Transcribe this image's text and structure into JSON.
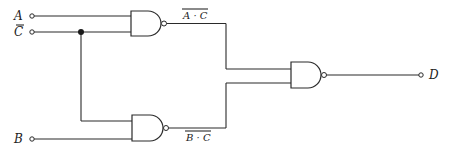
{
  "diagram": {
    "type": "logic-circuit",
    "inputs": [
      {
        "id": "A",
        "label": "A"
      },
      {
        "id": "C",
        "label": "C"
      },
      {
        "id": "B",
        "label": "B"
      }
    ],
    "output": {
      "id": "D",
      "label": "D"
    },
    "gates": [
      {
        "id": "nand1",
        "type": "NAND",
        "inputs": [
          "A",
          "C"
        ],
        "output_label": "A · C",
        "overbar": true
      },
      {
        "id": "nand2",
        "type": "NAND",
        "inputs": [
          "C",
          "B"
        ],
        "output_label": "B · C",
        "overbar": true
      },
      {
        "id": "nand3",
        "type": "NAND",
        "inputs": [
          "nand1",
          "nand2"
        ],
        "output": "D"
      }
    ],
    "labels": {
      "a": "A",
      "c": "C",
      "b": "B",
      "d": "D",
      "nand1_out": "A · C",
      "nand2_out": "B · C"
    },
    "colors": {
      "line": "#2a2a2a",
      "background": "#ffffff"
    }
  }
}
